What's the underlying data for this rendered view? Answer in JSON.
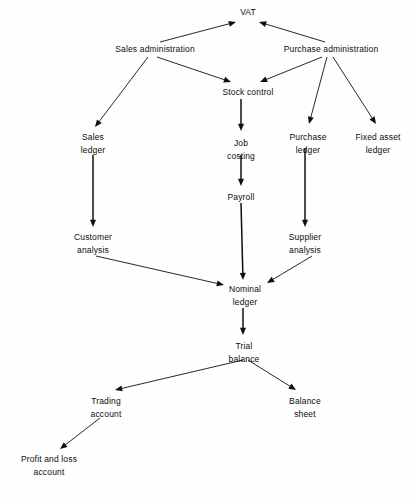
{
  "diagram": {
    "background_color": "#fefefe",
    "line_color": "#101010",
    "text_color": "#0d0d0d",
    "nodes": [
      {
        "id": "vat",
        "label_line1": "VAT",
        "label_line2": "",
        "x": 248,
        "y": 6
      },
      {
        "id": "sales-admin",
        "label_line1": "Sales administration",
        "label_line2": "",
        "x": 155,
        "y": 43
      },
      {
        "id": "purchase-admin",
        "label_line1": "Purchase administration",
        "label_line2": "",
        "x": 331,
        "y": 43
      },
      {
        "id": "stock-control",
        "label_line1": "Stock control",
        "label_line2": "",
        "x": 248,
        "y": 86
      },
      {
        "id": "sales-ledger",
        "label_line1": "Sales",
        "label_line2": "ledger",
        "x": 93,
        "y": 131
      },
      {
        "id": "job-costing",
        "label_line1": "Job",
        "label_line2": "costing",
        "x": 241,
        "y": 137
      },
      {
        "id": "purchase-ledger",
        "label_line1": "Purchase",
        "label_line2": "ledger",
        "x": 308,
        "y": 131
      },
      {
        "id": "fixed-asset-ledger",
        "label_line1": "Fixed asset",
        "label_line2": "ledger",
        "x": 378,
        "y": 131
      },
      {
        "id": "payroll",
        "label_line1": "Payroll",
        "label_line2": "",
        "x": 241,
        "y": 191
      },
      {
        "id": "customer-analysis",
        "label_line1": "Customer",
        "label_line2": "analysis",
        "x": 93,
        "y": 231
      },
      {
        "id": "supplier-analysis",
        "label_line1": "Supplier",
        "label_line2": "analysis",
        "x": 305,
        "y": 231
      },
      {
        "id": "nominal-ledger",
        "label_line1": "Nominal",
        "label_line2": "ledger",
        "x": 245,
        "y": 283
      },
      {
        "id": "trial-balance",
        "label_line1": "Trial",
        "label_line2": "balance",
        "x": 244,
        "y": 340
      },
      {
        "id": "trading-account",
        "label_line1": "Trading",
        "label_line2": "account",
        "x": 106,
        "y": 395
      },
      {
        "id": "balance-sheet",
        "label_line1": "Balance",
        "label_line2": "sheet",
        "x": 305,
        "y": 395
      },
      {
        "id": "profit-loss-account",
        "label_line1": "Profit and loss",
        "label_line2": "account",
        "x": 49,
        "y": 453
      }
    ],
    "edges": [
      {
        "id": "sales-admin-to-vat",
        "from": "sales-admin",
        "to": "vat",
        "x1": 160,
        "y1": 42,
        "x2": 236,
        "y2": 22
      },
      {
        "id": "purchase-admin-to-vat",
        "from": "purchase-admin",
        "to": "vat",
        "x1": 325,
        "y1": 42,
        "x2": 259,
        "y2": 22
      },
      {
        "id": "sales-admin-to-sales-ledger",
        "from": "sales-admin",
        "to": "sales-ledger",
        "x1": 148,
        "y1": 57,
        "x2": 95,
        "y2": 127
      },
      {
        "id": "sales-admin-to-stock-control",
        "from": "sales-admin",
        "to": "stock-control",
        "x1": 157,
        "y1": 57,
        "x2": 231,
        "y2": 82
      },
      {
        "id": "purchase-admin-to-stock-control",
        "from": "purchase-admin",
        "to": "stock-control",
        "x1": 322,
        "y1": 57,
        "x2": 260,
        "y2": 82
      },
      {
        "id": "purchase-admin-to-purchase-ledger",
        "from": "purchase-admin",
        "to": "purchase-ledger",
        "x1": 327,
        "y1": 57,
        "x2": 309,
        "y2": 124
      },
      {
        "id": "purchase-admin-to-fixed-asset",
        "from": "purchase-admin",
        "to": "fixed-asset-ledger",
        "x1": 333,
        "y1": 57,
        "x2": 376,
        "y2": 124
      },
      {
        "id": "stock-control-to-job-costing",
        "from": "stock-control",
        "to": "job-costing",
        "x1": 241,
        "y1": 99,
        "x2": 241,
        "y2": 131
      },
      {
        "id": "job-costing-to-payroll",
        "from": "job-costing",
        "to": "payroll",
        "x1": 241,
        "y1": 155,
        "x2": 241,
        "y2": 186
      },
      {
        "id": "sales-ledger-to-customer-analysis",
        "from": "sales-ledger",
        "to": "customer-analysis",
        "x1": 93,
        "y1": 155,
        "x2": 93,
        "y2": 227
      },
      {
        "id": "purchase-ledger-to-supplier-analysis",
        "from": "purchase-ledger",
        "to": "supplier-analysis",
        "x1": 305,
        "y1": 148,
        "x2": 305,
        "y2": 227
      },
      {
        "id": "payroll-to-nominal-ledger",
        "from": "payroll",
        "to": "nominal-ledger",
        "x1": 241,
        "y1": 203,
        "x2": 243,
        "y2": 280
      },
      {
        "id": "customer-analysis-to-nominal-ledger",
        "from": "customer-analysis",
        "to": "nominal-ledger",
        "x1": 96,
        "y1": 256,
        "x2": 224,
        "y2": 285
      },
      {
        "id": "supplier-analysis-to-nominal-ledger",
        "from": "supplier-analysis",
        "to": "nominal-ledger",
        "x1": 312,
        "y1": 256,
        "x2": 267,
        "y2": 283
      },
      {
        "id": "nominal-ledger-to-trial-balance",
        "from": "nominal-ledger",
        "to": "trial-balance",
        "x1": 243,
        "y1": 308,
        "x2": 243,
        "y2": 335
      },
      {
        "id": "trial-balance-to-trading-account",
        "from": "trial-balance",
        "to": "trading-account",
        "x1": 243,
        "y1": 360,
        "x2": 115,
        "y2": 390
      },
      {
        "id": "trial-balance-to-balance-sheet",
        "from": "trial-balance",
        "to": "balance-sheet",
        "x1": 248,
        "y1": 360,
        "x2": 296,
        "y2": 390
      },
      {
        "id": "trading-account-to-profit-loss",
        "from": "trading-account",
        "to": "profit-loss-account",
        "x1": 100,
        "y1": 418,
        "x2": 60,
        "y2": 449
      }
    ]
  }
}
